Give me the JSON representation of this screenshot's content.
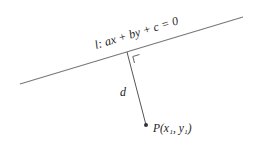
{
  "diagram": {
    "line": {
      "label": "l: ax + by + c = 0",
      "label_name": "l",
      "equation": "ax + by + c = 0",
      "start": [
        20,
        84
      ],
      "end": [
        243,
        17
      ],
      "color": "#777777"
    },
    "perpendicular": {
      "label": "d",
      "foot": [
        127,
        52
      ],
      "to": [
        146,
        125
      ],
      "color": "#555555"
    },
    "right_angle_marker": true,
    "point": {
      "label": "P(x₁, y₁)",
      "name": "P",
      "coords_text": "(x₁, y₁)",
      "position": [
        146,
        125
      ],
      "color": "#333333"
    }
  }
}
